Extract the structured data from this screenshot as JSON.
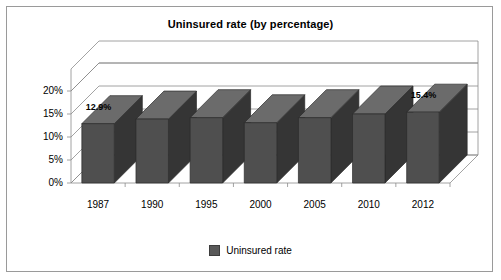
{
  "chart_data": {
    "type": "bar",
    "title": "Uninsured rate (by percentage)",
    "xlabel": "",
    "ylabel": "",
    "categories": [
      "1987",
      "1990",
      "1995",
      "2000",
      "2005",
      "2010",
      "2012"
    ],
    "values": [
      12.9,
      13.9,
      14.2,
      13.1,
      14.2,
      15.0,
      15.4
    ],
    "value_labels": [
      "12.9%",
      "",
      "",
      "",
      "",
      "",
      "15.4%"
    ],
    "series": [
      {
        "name": "Uninsured rate",
        "values": [
          12.9,
          13.9,
          14.2,
          13.1,
          14.2,
          15.0,
          15.4
        ]
      }
    ],
    "ylim": [
      0,
      20
    ],
    "yticks": [
      0,
      5,
      10,
      15,
      20
    ],
    "ytick_labels": [
      "0%",
      "5%",
      "10%",
      "15%",
      "20%"
    ],
    "grid": true,
    "style": "3d-column",
    "legend": "bottom-center",
    "legend_entries": [
      "Uninsured rate"
    ],
    "colors": {
      "bar_front": "#4f4f4f",
      "bar_side": "#353535",
      "bar_top": "#6b6b6b",
      "gridline": "#8c8c8c",
      "axis": "#8c8c8c",
      "frame": "#9a9a9a",
      "text": "#000000"
    }
  },
  "legend": {
    "label": "Uninsured rate"
  }
}
